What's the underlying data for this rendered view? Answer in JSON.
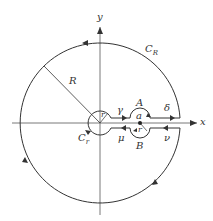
{
  "diagram": {
    "type": "keyhole contour",
    "labels": {
      "y_axis": "y",
      "x_axis": "x",
      "outer_circle": "C",
      "outer_circle_sub": "R",
      "radius": "R",
      "small_radius": "r",
      "inner_circle": "C",
      "inner_circle_sub": "r",
      "gamma": "γ",
      "A": "A",
      "delta": "δ",
      "a": "a",
      "r_at_a": "r",
      "mu": "μ",
      "B": "B",
      "nu": "ν"
    },
    "colors": {
      "stroke": "#333333",
      "background": "#ffffff"
    }
  }
}
